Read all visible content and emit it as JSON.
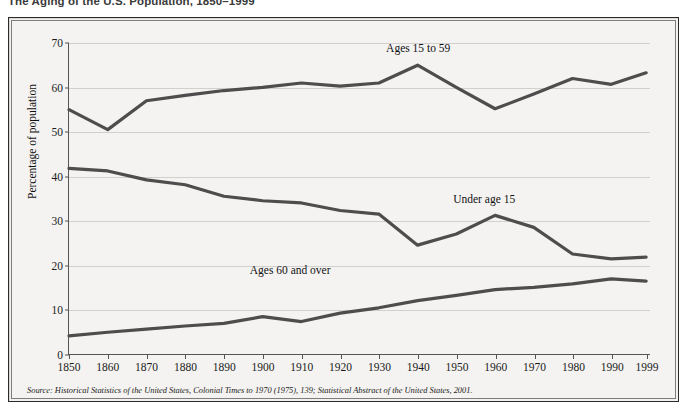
{
  "figure": {
    "title": "The Aging of the U.S. Population, 1850–1999",
    "source": "Source: Historical Statistics of the United States, Colonial Times to 1970 (1975), 139; Statistical Abstract of the United States, 2001."
  },
  "colors": {
    "panel_background": "#f4f3f1",
    "panel_border": "#2b2b2b",
    "gridline": "#d2d0cd",
    "axis": "#555555",
    "series_line": "#4d4d4d",
    "text": "#111111"
  },
  "chart_data": {
    "type": "line",
    "title": "The Aging of the U.S. Population, 1850–1999",
    "xlabel": "",
    "ylabel": "Percentage of population",
    "ylim": [
      0,
      70
    ],
    "yticks": [
      0,
      10,
      20,
      30,
      40,
      50,
      60,
      70
    ],
    "grid": true,
    "legend": "inline-labels",
    "categories": [
      1850,
      1860,
      1870,
      1880,
      1890,
      1900,
      1910,
      1920,
      1930,
      1940,
      1950,
      1960,
      1970,
      1980,
      1990,
      1999
    ],
    "xtick_labels": [
      "1850",
      "1860",
      "1870",
      "1880",
      "1890",
      "1900",
      "1910",
      "1920",
      "1930",
      "1940",
      "1950",
      "1960",
      "1970",
      "1980",
      "1990",
      "1999"
    ],
    "series": [
      {
        "name": "Ages 15 to 59",
        "label_x_year": 1940,
        "label_y_value": 68.5,
        "values": [
          55.0,
          50.5,
          57.0,
          58.2,
          59.3,
          60.0,
          61.0,
          60.3,
          61.0,
          65.0,
          60.0,
          55.2,
          58.5,
          62.0,
          60.7,
          63.3
        ]
      },
      {
        "name": "Under age 15",
        "label_x_year": 1957,
        "label_y_value": 34.5,
        "values": [
          41.8,
          41.2,
          39.2,
          38.1,
          35.5,
          34.5,
          34.0,
          32.3,
          31.5,
          24.5,
          27.0,
          31.2,
          28.5,
          22.5,
          21.4,
          21.8
        ]
      },
      {
        "name": "Ages 60 and over",
        "label_x_year": 1907,
        "label_y_value": 18.6,
        "values": [
          4.1,
          4.9,
          5.6,
          6.3,
          6.9,
          8.4,
          7.3,
          9.2,
          10.4,
          12.0,
          13.2,
          14.5,
          15.0,
          15.8,
          16.9,
          16.4
        ]
      }
    ]
  }
}
